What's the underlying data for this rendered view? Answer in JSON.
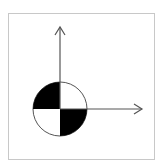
{
  "diagram": {
    "type": "center-of-gravity-symbol",
    "colors": {
      "background": "#ffffff",
      "frame": "#c8c8c8",
      "stroke": "#555555",
      "fill_dark": "#000000",
      "fill_light": "#ffffff"
    },
    "frame": {
      "x": 8,
      "y": 13,
      "w": 147,
      "h": 147
    },
    "origin": {
      "x": 60,
      "y": 109
    },
    "circle_radius": 27,
    "axes": [
      {
        "name": "y-axis",
        "direction": "up",
        "end": {
          "x": 60,
          "y": 27
        }
      },
      {
        "name": "x-axis",
        "direction": "right",
        "end": {
          "x": 142,
          "y": 109
        }
      }
    ]
  }
}
